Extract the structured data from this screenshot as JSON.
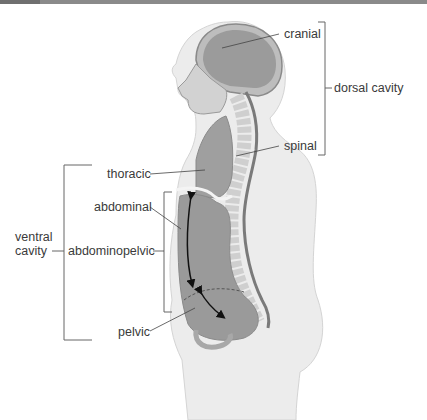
{
  "figure": {
    "labels": {
      "cranial": "cranial",
      "dorsal_cavity": "dorsal cavity",
      "spinal": "spinal",
      "thoracic": "thoracic",
      "abdominal": "abdominal",
      "ventral_cavity_line1": "ventral",
      "ventral_cavity_line2": "cavity",
      "abdominopelvic": "abdominopelvic",
      "pelvic": "pelvic"
    },
    "groups": [
      {
        "name": "dorsal cavity",
        "members": [
          "cranial",
          "spinal"
        ]
      },
      {
        "name": "ventral cavity",
        "members": [
          "thoracic",
          "abdominopelvic"
        ]
      },
      {
        "name": "abdominopelvic",
        "members": [
          "abdominal",
          "pelvic"
        ]
      }
    ],
    "colors": {
      "body_fill": "#ececec",
      "cavity_fill": "#9a9a9a",
      "bone_fill": "#d6d6d6",
      "leader_line": "#555555",
      "header_bar": "#8a8a8a"
    }
  }
}
